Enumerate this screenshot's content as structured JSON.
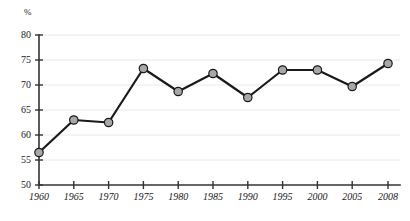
{
  "chart_data": {
    "type": "line",
    "title": "",
    "subtitle": "",
    "xlabel": "",
    "ylabel": "%",
    "unit_label": "%",
    "categories": [
      "1960",
      "1965",
      "1970",
      "1975",
      "1980",
      "1985",
      "1990",
      "1995",
      "2000",
      "2005",
      "2008"
    ],
    "x": [
      1960,
      1965,
      1970,
      1975,
      1980,
      1985,
      1990,
      1995,
      2000,
      2005,
      2008
    ],
    "values": [
      56.5,
      63.0,
      62.5,
      73.3,
      68.7,
      72.3,
      67.5,
      73.0,
      73.0,
      69.7,
      74.3
    ],
    "series": [
      {
        "name": "",
        "values": [
          56.5,
          63.0,
          62.5,
          73.3,
          68.7,
          72.3,
          67.5,
          73.0,
          73.0,
          69.7,
          74.3
        ]
      }
    ],
    "ylim": [
      50,
      80
    ],
    "yticks": [
      50,
      55,
      60,
      65,
      70,
      75,
      80
    ],
    "ytick_labels": [
      "50",
      "55",
      "60",
      "65",
      "70",
      "75",
      "80"
    ],
    "xtick_labels": [
      "1960",
      "1965",
      "1970",
      "1975",
      "1980",
      "1985",
      "1990",
      "1995",
      "2000",
      "2005",
      "2008"
    ],
    "grid": true,
    "grid_axis": "y",
    "legend": false,
    "legend_position": "none",
    "annotations": [],
    "colors": {
      "line": "#1a1a1a",
      "marker_fill": "#a8a8a8",
      "marker_stroke": "#1a1a1a",
      "axis": "#333333",
      "grid": "#e8e8e8",
      "text": "#1a1a1a",
      "background": "#ffffff"
    }
  }
}
